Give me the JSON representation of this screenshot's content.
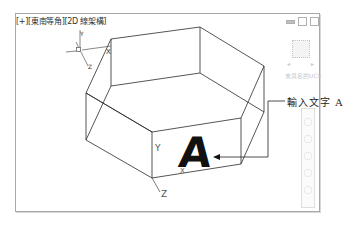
{
  "viewport": {
    "label": "[+][東南等角][2D 線架構]",
    "controls": [
      "minimize",
      "restore",
      "close"
    ],
    "viewcube_label": "未具名的UCS"
  },
  "scene": {
    "text_object": "A",
    "ucs_axis_labels": {
      "x": "X",
      "y": "Y",
      "z": "Z"
    },
    "cursor_axis_labels": {
      "y": "Y",
      "z": "Z",
      "x": "X"
    },
    "line_color": "#2a2a2a"
  },
  "annotation": {
    "callout": "輸入文字 A"
  }
}
